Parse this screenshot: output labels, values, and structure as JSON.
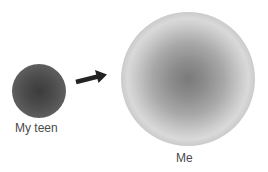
{
  "diagram": {
    "nodes": [
      {
        "id": "teen",
        "label": "My teen",
        "shape": "circle",
        "size": "small",
        "fill": "#4a4a4a"
      },
      {
        "id": "me",
        "label": "Me",
        "shape": "circle",
        "size": "large",
        "fill": "#a8a8a8"
      }
    ],
    "edges": [
      {
        "from": "teen",
        "to": "me",
        "type": "arrow",
        "color": "#222222"
      }
    ]
  },
  "labels": {
    "teen": "My teen",
    "me": "Me"
  },
  "colors": {
    "background": "#ffffff",
    "arrow": "#222222",
    "label_text": "#4a4a4a"
  }
}
